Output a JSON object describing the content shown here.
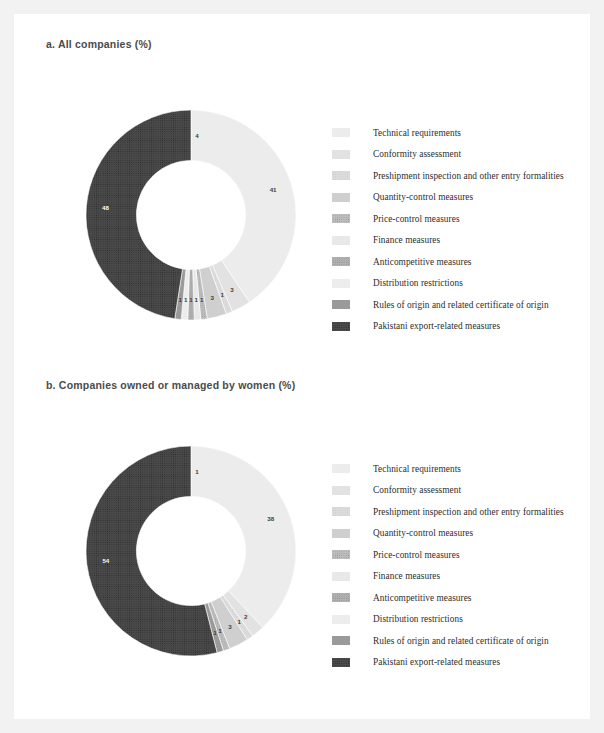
{
  "page": {
    "background": "#f2f2f2",
    "card_background": "#ffffff"
  },
  "panels": [
    {
      "id": "panel-a",
      "title": "a. All companies (%)"
    },
    {
      "id": "panel-b",
      "title": "b. Companies owned or managed by women (%)"
    }
  ],
  "legend_items": [
    {
      "label": "Technical requirements",
      "color": "#ececec",
      "pattern": "none"
    },
    {
      "label": "Conformity assessment",
      "color": "#e2e2e2",
      "pattern": "none"
    },
    {
      "label": "Preshipment inspection and other entry formalities",
      "color": "#dcdcdc",
      "pattern": "dots-light"
    },
    {
      "label": "Quantity-control measures",
      "color": "#cfcfcf",
      "pattern": "none"
    },
    {
      "label": "Price-control measures",
      "color": "#bdbdbd",
      "pattern": "dots-mid"
    },
    {
      "label": "Finance measures",
      "color": "#e8e8e8",
      "pattern": "none"
    },
    {
      "label": "Anticompetitive measures",
      "color": "#b0b0b0",
      "pattern": "dots-mid"
    },
    {
      "label": "Distribution restrictions",
      "color": "#ededed",
      "pattern": "none"
    },
    {
      "label": "Rules of origin and related certificate of origin",
      "color": "#9a9a9a",
      "pattern": "none"
    },
    {
      "label": "Pakistani export-related measures",
      "color": "#4a4a4a",
      "pattern": "dots-dark"
    }
  ],
  "chart_data": [
    {
      "type": "pie",
      "title": "a. All companies (%)",
      "subtitle": "",
      "donut": true,
      "hole_ratio": 0.52,
      "units": "%",
      "legend_position": "right",
      "grid": false,
      "start_angle_deg": 0,
      "categories": [
        "Technical requirements",
        "Conformity assessment",
        "Preshipment inspection and other entry formalities",
        "Quantity-control measures",
        "Price-control measures",
        "Finance measures",
        "Anticompetitive measures",
        "Distribution restrictions",
        "Rules of origin and related certificate of origin",
        "Pakistani export-related measures"
      ],
      "values": [
        41,
        3,
        1,
        3,
        1,
        1,
        1,
        1,
        1,
        48
      ],
      "labels_shown": [
        "41",
        "3",
        "1",
        "3",
        "1",
        "1",
        "1",
        "1",
        "1",
        "48"
      ],
      "top_label": "4",
      "annotations": [
        "4",
        "41",
        "3",
        "1",
        "3",
        "1",
        "1",
        "48"
      ]
    },
    {
      "type": "pie",
      "title": "b. Companies owned or managed by women (%)",
      "subtitle": "",
      "donut": true,
      "hole_ratio": 0.52,
      "units": "%",
      "legend_position": "right",
      "grid": false,
      "start_angle_deg": 0,
      "categories": [
        "Technical requirements",
        "Conformity assessment",
        "Preshipment inspection and other entry formalities",
        "Quantity-control measures",
        "Price-control measures",
        "Finance measures",
        "Anticompetitive measures",
        "Distribution restrictions",
        "Rules of origin and related certificate of origin",
        "Pakistani export-related measures"
      ],
      "values": [
        38,
        2,
        1,
        3,
        1,
        0,
        0,
        0,
        1,
        54
      ],
      "labels_shown": [
        "38",
        "2",
        "1",
        "3",
        "1",
        "",
        "",
        "",
        "1",
        "54"
      ],
      "top_label": "1",
      "annotations": [
        "1",
        "38",
        "2",
        "1",
        "3",
        "1",
        "54"
      ]
    }
  ]
}
